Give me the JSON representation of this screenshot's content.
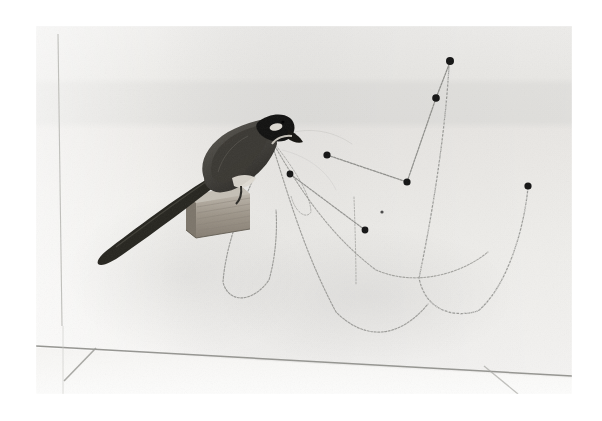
{
  "image": {
    "kind": "black-and-white-photograph",
    "subject": "taxidermy long-tailed bird perched on a wooden block holding chains in its beak",
    "caption": "",
    "border": {
      "color": "#ffffff",
      "left": 36,
      "top": 26,
      "right": 30,
      "bottom": 27
    },
    "frame": {
      "x": 36,
      "y": 26,
      "width": 536,
      "height": 368
    },
    "palette": {
      "paper_white": "#ffffff",
      "wall_light": "#f4f3f1",
      "wall_mid": "#e9e8e5",
      "wall_band": "#e2e1de",
      "floor_light": "#f7f7f5",
      "line_gray": "#9a9a96",
      "chain_gray": "#8d8d89",
      "pin_black": "#1a1a1a",
      "bird_dark": "#2e2d2b",
      "bird_body": "#4b4945",
      "bird_head_black": "#131211",
      "bird_cheek_white": "#ece9e3",
      "wood_light": "#c9c4ba",
      "wood_mid": "#a49d92",
      "wood_dark": "#6f685e"
    }
  },
  "scene": {
    "background": {
      "description": "pale studio wall with a faint horizontal tonal band across the upper third",
      "band_top_y": 55,
      "band_bottom_y": 98
    },
    "wall_lines": [
      {
        "name": "vertical-corner-line",
        "x1": 22,
        "y1": 8,
        "x2": 26,
        "y2": 300,
        "label": "vertical wall seam at left"
      },
      {
        "name": "floor-wall-junction",
        "x1": 0,
        "y1": 320,
        "x2": 536,
        "y2": 350,
        "label": "floor / wall junction"
      },
      {
        "name": "floor-diagonal-left",
        "x1": 28,
        "y1": 355,
        "x2": 60,
        "y2": 322,
        "label": "floor seam running left-down"
      },
      {
        "name": "floor-diagonal-right",
        "x1": 448,
        "y1": 340,
        "x2": 482,
        "y2": 368,
        "label": "floor seam running right-down"
      }
    ],
    "bird": {
      "name": "perched-bird",
      "pose": "facing right, head lowered, long tail sweeping down to the left",
      "tail_tip": {
        "x": 40,
        "y": 225
      },
      "beak_tip": {
        "x": 235,
        "y": 118
      },
      "markings": [
        "black head",
        "white cheek patch",
        "dark grey-brown body",
        "pale breast",
        "long dark tail"
      ]
    },
    "perch": {
      "name": "wooden-block-perch",
      "x": 152,
      "y": 160,
      "width": 62,
      "height": 48,
      "description": "layered plywood block with visible laminations"
    },
    "pins": [
      {
        "id": "pin-top-right",
        "x": 414,
        "y": 35,
        "r": 4.0
      },
      {
        "id": "pin-upper-right",
        "x": 400,
        "y": 72,
        "r": 3.8
      },
      {
        "id": "pin-mid-left",
        "x": 291,
        "y": 129,
        "r": 3.6
      },
      {
        "id": "pin-mid-left-low",
        "x": 254,
        "y": 148,
        "r": 3.4
      },
      {
        "id": "pin-valley",
        "x": 371,
        "y": 156,
        "r": 3.6
      },
      {
        "id": "pin-center-low",
        "x": 329,
        "y": 204,
        "r": 3.4
      },
      {
        "id": "pin-far-right",
        "x": 492,
        "y": 160,
        "r": 3.6
      },
      {
        "id": "pin-tiny-dot",
        "x": 346,
        "y": 186,
        "r": 1.6
      }
    ],
    "chains": [
      {
        "id": "chain-beak-1",
        "type": "catenary",
        "label": "leftmost drape from beak down to floor loop and back to perch",
        "from": "beak",
        "points": "235,118 222,140 205,175 193,215 186,250 190,272 205,282 225,272 236,248 240,215 240,185"
      },
      {
        "id": "chain-beak-2",
        "type": "catenary",
        "label": "long sweeping drape from beak to lower right",
        "from": "beak",
        "points": "236,118 250,150 263,195 280,245 302,288 327,311 352,313 375,300 392,278"
      },
      {
        "id": "chain-beak-3",
        "type": "catenary",
        "label": "mid drape from beak arcing right toward the valley pin",
        "from": "beak",
        "points": "237,117 255,140 275,170 299,205 326,235 356,254 390,258 424,247 450,228"
      },
      {
        "id": "chain-beak-4",
        "type": "catenary",
        "label": "short inner drape hooking back up under the beak",
        "from": "beak",
        "points": "238,117 252,133 265,152 274,172 276,186 270,192 261,186 256,172"
      },
      {
        "id": "chain-taut-a",
        "type": "taut",
        "label": "straight chain from mid-left pin down to the valley pin",
        "points": "291,129 371,156"
      },
      {
        "id": "chain-taut-b",
        "type": "taut",
        "label": "straight chain from valley pin up to the upper-right pin",
        "points": "371,156 400,72"
      },
      {
        "id": "chain-taut-c",
        "type": "taut",
        "label": "short straight chain from upper-right pin to the topmost pin",
        "points": "400,72 414,35"
      },
      {
        "id": "chain-taut-d",
        "type": "taut",
        "label": "straight chain from mid-left-low pin down to the center-low pin",
        "points": "254,148 329,204"
      },
      {
        "id": "chain-right-u",
        "type": "catenary",
        "label": "wide U-shaped drape swinging from under the top pins out to the far-right pin",
        "points": "413,40 408,95 400,150 390,205 382,252 390,280 410,292 438,288 462,262 480,216 490,180 492,161"
      },
      {
        "id": "chain-vertical-drop",
        "type": "vertical",
        "label": "short vertical chain hanging free in the middle of the field",
        "points": "318,172 319,200 320,232 320,258"
      }
    ]
  }
}
